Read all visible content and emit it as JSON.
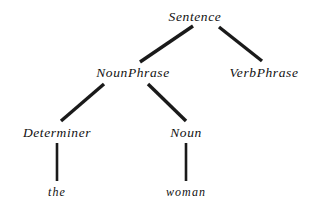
{
  "diagram": {
    "kind": "constituency-parse-tree",
    "sentence": "the woman",
    "background_color": "#ffffff",
    "edge_color": "#1a1a1a",
    "text_color": "#111111",
    "nodes": [
      {
        "id": "sentence",
        "label": "Sentence",
        "level": 0,
        "type": "nonterminal",
        "x": 195,
        "y": 17
      },
      {
        "id": "nounphrase",
        "label": "NounPhrase",
        "level": 1,
        "type": "nonterminal",
        "x": 133,
        "y": 73
      },
      {
        "id": "verbphrase",
        "label": "VerbPhrase",
        "level": 1,
        "type": "nonterminal",
        "x": 264,
        "y": 73
      },
      {
        "id": "determiner",
        "label": "Determiner",
        "level": 2,
        "type": "nonterminal",
        "x": 57,
        "y": 133
      },
      {
        "id": "noun",
        "label": "Noun",
        "level": 2,
        "type": "nonterminal",
        "x": 186,
        "y": 133
      },
      {
        "id": "the",
        "label": "the",
        "level": 3,
        "type": "terminal",
        "x": 57,
        "y": 192
      },
      {
        "id": "woman",
        "label": "woman",
        "level": 3,
        "type": "terminal",
        "x": 186,
        "y": 192
      }
    ],
    "edges": [
      {
        "id": "edge-sentence-nounphrase",
        "from": "sentence",
        "to": "nounphrase",
        "x1": 193,
        "y1": 26,
        "x2": 140,
        "y2": 62,
        "width": 3.4
      },
      {
        "id": "edge-sentence-verbphrase",
        "from": "sentence",
        "to": "verbphrase",
        "x1": 219,
        "y1": 27,
        "x2": 262,
        "y2": 61,
        "width": 3.4
      },
      {
        "id": "edge-nounphrase-determiner",
        "from": "nounphrase",
        "to": "determiner",
        "x1": 104,
        "y1": 84,
        "x2": 61,
        "y2": 121,
        "width": 3.4
      },
      {
        "id": "edge-nounphrase-noun",
        "from": "nounphrase",
        "to": "noun",
        "x1": 148,
        "y1": 84,
        "x2": 186,
        "y2": 121,
        "width": 3.4
      },
      {
        "id": "edge-determiner-the",
        "from": "determiner",
        "to": "the",
        "x1": 57,
        "y1": 143,
        "x2": 57,
        "y2": 181,
        "width": 2.6
      },
      {
        "id": "edge-noun-woman",
        "from": "noun",
        "to": "woman",
        "x1": 186,
        "y1": 143,
        "x2": 186,
        "y2": 181,
        "width": 2.6
      }
    ]
  }
}
